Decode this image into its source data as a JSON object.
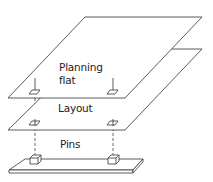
{
  "diagram": {
    "type": "exploded layer stack",
    "layers": [
      {
        "id": "planning-flat",
        "label_line1": "Planning",
        "label_line2": "flat"
      },
      {
        "id": "layout",
        "label": "Layout"
      },
      {
        "id": "pins",
        "label": "Pins"
      }
    ],
    "connectors": 2,
    "colors": {
      "stroke": "#333333",
      "fill": "#ffffff",
      "dashed": "#444444"
    }
  }
}
